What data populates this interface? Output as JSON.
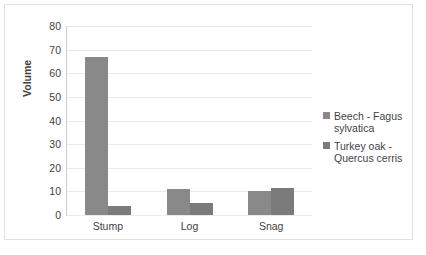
{
  "chart_data": {
    "type": "bar",
    "title": "",
    "xlabel": "",
    "ylabel": "Volume",
    "categories": [
      "Stump",
      "Log",
      "Snag"
    ],
    "series": [
      {
        "name": "Beech - Fagus sylvatica",
        "values": [
          67,
          11,
          10
        ],
        "color": "#898989"
      },
      {
        "name": "Turkey oak - Quercus cerris",
        "values": [
          4,
          5,
          11.5
        ],
        "color": "#7b7b7b"
      }
    ],
    "ylim": [
      0,
      80
    ],
    "ytick_step": 10,
    "yticks": [
      "0",
      "10",
      "20",
      "30",
      "40",
      "50",
      "60",
      "70",
      "80"
    ],
    "grid": true,
    "grid_axis": "y",
    "legend_position": "right",
    "legend": [
      {
        "line1": "Beech - Fagus",
        "line2": "sylvatica"
      },
      {
        "line1": "Turkey oak -",
        "line2": "Quercus cerris"
      }
    ]
  }
}
